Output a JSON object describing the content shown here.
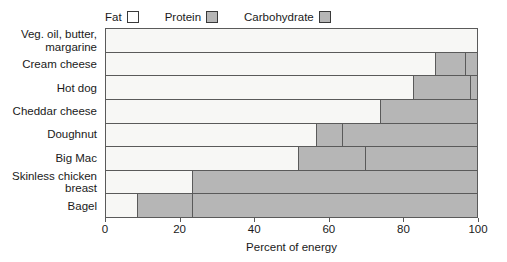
{
  "chart_data": {
    "type": "bar",
    "orientation": "horizontal",
    "stacked": true,
    "title": "",
    "xlabel": "Percent of energy",
    "ylabel": "",
    "xlim": [
      0,
      100
    ],
    "xticks": [
      0,
      20,
      40,
      60,
      80,
      100
    ],
    "xticklabels": [
      "0",
      "20",
      "40",
      "60",
      "80",
      "100"
    ],
    "grid": false,
    "legend_position": "top-left",
    "categories": [
      "Veg. oil, butter, margarine",
      "Cream cheese",
      "Hot dog",
      "Cheddar cheese",
      "Doughnut",
      "Big Mac",
      "Skinless chicken breast",
      "Bagel"
    ],
    "category_lines": [
      [
        "Veg. oil, butter,",
        "margarine"
      ],
      [
        "Cream cheese"
      ],
      [
        "Hot dog"
      ],
      [
        "Cheddar cheese"
      ],
      [
        "Doughnut"
      ],
      [
        "Big Mac"
      ],
      [
        "Skinless chicken",
        "breast"
      ],
      [
        "Bagel"
      ]
    ],
    "series": [
      {
        "name": "Fat",
        "color": "#f7f7f5",
        "values": [
          100,
          89,
          83,
          74,
          57,
          52,
          23.5,
          8.5
        ]
      },
      {
        "name": "Protein",
        "color": "#b6b6b6",
        "values": [
          0,
          8,
          15.5,
          26,
          7,
          18,
          76.5,
          15
        ]
      },
      {
        "name": "Carbohydrate",
        "color": "#b6b6b6",
        "values": [
          0,
          3,
          1.5,
          0,
          36,
          30,
          0,
          76.5
        ]
      }
    ]
  },
  "legend": {
    "entries": [
      {
        "label": "Fat",
        "swatch_name": "fat-swatch",
        "color": "#ffffff"
      },
      {
        "label": "Protein",
        "swatch_name": "protein-swatch",
        "color": "#b6b6b6"
      },
      {
        "label": "Carbohydrate",
        "swatch_name": "carbohydrate-swatch",
        "color": "#b6b6b6"
      }
    ]
  }
}
